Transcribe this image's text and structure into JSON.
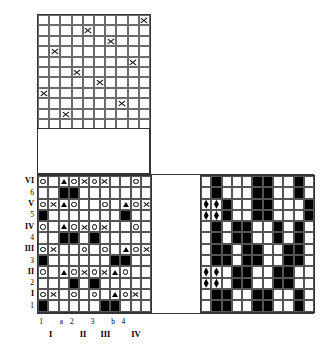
{
  "diagram": {
    "type": "weaving-draft",
    "colors": {
      "ink": "#000000",
      "grid_line": "#555555",
      "background": "#ffffff"
    }
  },
  "threading": {
    "name": "threading-grid",
    "cols": 10,
    "rows": 11,
    "symbol": "X",
    "marks": [
      {
        "row": 0,
        "col": 9
      },
      {
        "row": 1,
        "col": 4
      },
      {
        "row": 2,
        "col": 6
      },
      {
        "row": 3,
        "col": 1
      },
      {
        "row": 4,
        "col": 8
      },
      {
        "row": 5,
        "col": 3
      },
      {
        "row": 6,
        "col": 5
      },
      {
        "row": 7,
        "col": 0
      },
      {
        "row": 8,
        "col": 7
      },
      {
        "row": 9,
        "col": 2
      },
      {
        "row": 10,
        "col": -1
      }
    ]
  },
  "treadling": {
    "name": "treadling-tieup-grid",
    "cols": 11,
    "rows": 12,
    "legend": {
      "circle": "o",
      "triangle": "triangle",
      "cross": "X",
      "filled": "black"
    },
    "rows_data": [
      {
        "label": "VI",
        "kind": "symbol",
        "cells": [
          "o",
          "",
          "tri",
          "o",
          "x",
          "o",
          "x",
          "",
          "",
          "o",
          ""
        ]
      },
      {
        "label": "6",
        "kind": "fill",
        "cells": [
          "",
          "",
          "blk",
          "blk",
          "",
          "",
          "",
          "",
          "",
          "",
          ""
        ]
      },
      {
        "label": "V",
        "kind": "symbol",
        "cells": [
          "o",
          "x",
          "tri",
          "o",
          "",
          "",
          "o",
          "",
          "tri",
          "o",
          "x"
        ]
      },
      {
        "label": "5",
        "kind": "fill",
        "cells": [
          "blk",
          "",
          "",
          "",
          "",
          "",
          "",
          "",
          "blk",
          "",
          ""
        ]
      },
      {
        "label": "IV",
        "kind": "symbol",
        "cells": [
          "o",
          "",
          "tri",
          "o",
          "x",
          "o",
          "x",
          "",
          "",
          "o",
          ""
        ]
      },
      {
        "label": "4",
        "kind": "fill",
        "cells": [
          "",
          "",
          "blk",
          "blk",
          "",
          "blk",
          "",
          "",
          "",
          "",
          ""
        ]
      },
      {
        "label": "III",
        "kind": "symbol",
        "cells": [
          "o",
          "x",
          "",
          "",
          "o",
          "",
          "o",
          "",
          "tri",
          "o",
          "x"
        ]
      },
      {
        "label": "3",
        "kind": "fill",
        "cells": [
          "blk",
          "",
          "",
          "",
          "",
          "",
          "",
          "blk",
          "blk",
          "",
          ""
        ]
      },
      {
        "label": "II",
        "kind": "symbol",
        "cells": [
          "o",
          "",
          "tri",
          "o",
          "x",
          "o",
          "x",
          "tri",
          "o",
          "",
          ""
        ]
      },
      {
        "label": "2",
        "kind": "fill",
        "cells": [
          "",
          "",
          "",
          "blk",
          "",
          "blk",
          "",
          "",
          "",
          "",
          ""
        ]
      },
      {
        "label": "I",
        "kind": "symbol",
        "cells": [
          "o",
          "x",
          "",
          "o",
          "",
          "o",
          "",
          "tri",
          "o",
          "x",
          ""
        ]
      },
      {
        "label": "1",
        "kind": "fill",
        "cells": [
          "blk",
          "",
          "",
          "",
          "",
          "",
          "blk",
          "blk",
          "",
          "",
          ""
        ]
      }
    ],
    "row_labels_left": [
      "VI",
      "6",
      "V",
      "5",
      "IV",
      "4",
      "III",
      "3",
      "II",
      "2",
      "I",
      "1"
    ],
    "bottom_labels_top": [
      {
        "text": "1",
        "col": 0
      },
      {
        "text": "a",
        "col": 2
      },
      {
        "text": "2",
        "col": 3
      },
      {
        "text": "3",
        "col": 5
      },
      {
        "text": "b",
        "col": 7
      },
      {
        "text": "4",
        "col": 8
      }
    ],
    "bottom_labels_bottom": [
      {
        "text": "I",
        "col": 1
      },
      {
        "text": "II",
        "col": 4
      },
      {
        "text": "III",
        "col": 6
      },
      {
        "text": "IV",
        "col": 9
      }
    ]
  },
  "drawdown": {
    "name": "drawdown-grid",
    "cols": 11,
    "rows": 12,
    "rows_data": [
      {
        "cells": [
          "",
          "blk",
          "",
          "",
          "",
          "blk",
          "blk",
          "",
          "",
          "blk",
          ""
        ]
      },
      {
        "cells": [
          "",
          "blk",
          "",
          "",
          "",
          "blk",
          "blk",
          "",
          "",
          "blk",
          ""
        ]
      },
      {
        "cells": [
          "dia",
          "dia",
          "blk",
          "",
          "",
          "blk",
          "blk",
          "",
          "",
          "",
          "blk"
        ]
      },
      {
        "cells": [
          "dia",
          "dia",
          "blk",
          "",
          "",
          "blk",
          "blk",
          "",
          "",
          "",
          "blk"
        ]
      },
      {
        "cells": [
          "",
          "blk",
          "",
          "blk",
          "blk",
          "",
          "",
          "blk",
          "",
          "blk",
          ""
        ]
      },
      {
        "cells": [
          "",
          "blk",
          "",
          "blk",
          "blk",
          "",
          "",
          "blk",
          "",
          "blk",
          ""
        ]
      },
      {
        "cells": [
          "",
          "blk",
          "blk",
          "",
          "blk",
          "blk",
          "",
          "",
          "blk",
          "blk",
          ""
        ]
      },
      {
        "cells": [
          "",
          "blk",
          "blk",
          "",
          "blk",
          "blk",
          "",
          "",
          "blk",
          "blk",
          ""
        ]
      },
      {
        "cells": [
          "dia",
          "dia",
          "",
          "blk",
          "blk",
          "",
          "",
          "blk",
          "blk",
          "",
          ""
        ]
      },
      {
        "cells": [
          "dia",
          "dia",
          "",
          "blk",
          "blk",
          "",
          "",
          "blk",
          "blk",
          "",
          ""
        ]
      },
      {
        "cells": [
          "",
          "blk",
          "blk",
          "",
          "",
          "blk",
          "blk",
          "",
          "",
          "blk",
          ""
        ]
      },
      {
        "cells": [
          "",
          "blk",
          "blk",
          "",
          "",
          "blk",
          "blk",
          "",
          "",
          "blk",
          ""
        ]
      }
    ]
  }
}
